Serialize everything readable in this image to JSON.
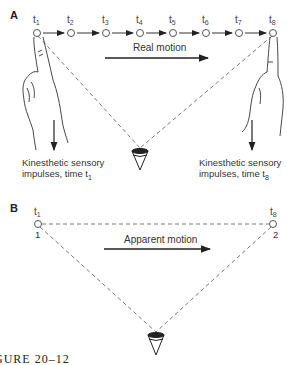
{
  "panels": {
    "A": {
      "label": "A",
      "time_labels": [
        "t1",
        "t2",
        "t3",
        "t4",
        "t5",
        "t6",
        "t7",
        "t8"
      ],
      "motion_label": "Real motion",
      "left_caption_line1": "Kinesthetic sensory",
      "left_caption_line2": "impulses, time t1",
      "right_caption_line1": "Kinesthetic sensory",
      "right_caption_line2": "impulses, time t8"
    },
    "B": {
      "label": "B",
      "left_time": "t1",
      "right_time": "t8",
      "left_number": "1",
      "right_number": "2",
      "motion_label": "Apparent motion"
    }
  },
  "caption": "GURE 20–12"
}
